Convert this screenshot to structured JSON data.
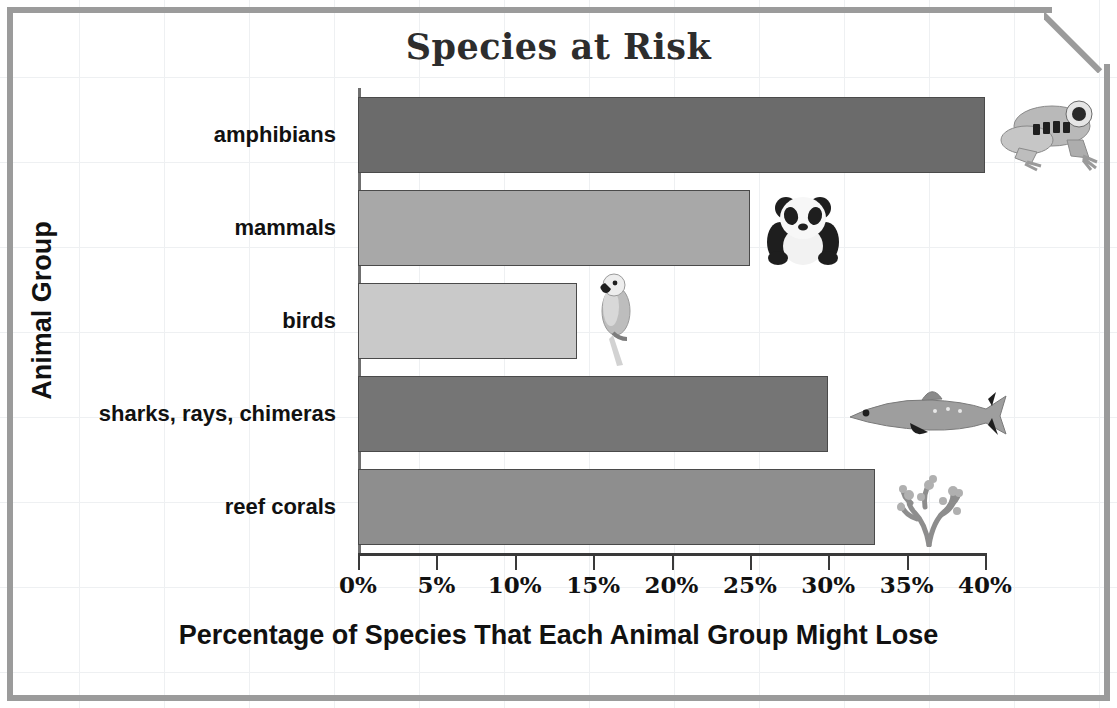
{
  "chart_data": {
    "type": "bar",
    "orientation": "horizontal",
    "title": "Species at Risk",
    "xlabel": "Percentage of Species That Each Animal Group Might Lose",
    "ylabel": "Animal Group",
    "categories": [
      "amphibians",
      "mammals",
      "birds",
      "sharks, rays, chimeras",
      "reef corals"
    ],
    "values": [
      40,
      25,
      14,
      30,
      33
    ],
    "value_unit": "%",
    "xlim": [
      0,
      40
    ],
    "xticks": [
      0,
      5,
      10,
      15,
      20,
      25,
      30,
      35,
      40
    ],
    "xtick_labels": [
      "0%",
      "5%",
      "10%",
      "15%",
      "20%",
      "25%",
      "30%",
      "35%",
      "40%"
    ],
    "grid": false,
    "legend": "none",
    "bar_colors": [
      "#6b6b6b",
      "#a8a8a8",
      "#c9c9c9",
      "#757575",
      "#8e8e8e"
    ],
    "icons": [
      "frog-icon",
      "panda-icon",
      "parrot-icon",
      "shark-icon",
      "coral-icon"
    ]
  },
  "frame": {
    "border_color": "#9b9b9b",
    "grid_color": "#eef0f2"
  }
}
